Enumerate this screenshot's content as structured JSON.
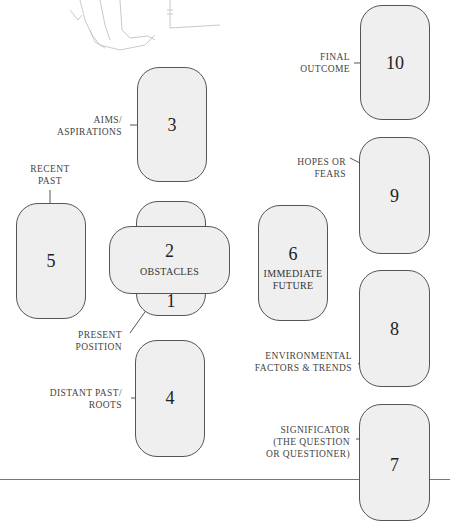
{
  "positions": [
    {
      "number": "1",
      "label": "PRESENT POSITION"
    },
    {
      "number": "2",
      "label": "OBSTACLES"
    },
    {
      "number": "3",
      "label_lines": [
        "AIMS/",
        "ASPIRATIONS"
      ]
    },
    {
      "number": "4",
      "label_lines": [
        "DISTANT PAST/",
        "ROOTS"
      ]
    },
    {
      "number": "5",
      "label_lines": [
        "RECENT",
        "PAST"
      ]
    },
    {
      "number": "6",
      "label_lines": [
        "IMMEDIATE",
        "FUTURE"
      ]
    },
    {
      "number": "7",
      "label_lines": [
        "SIGNIFICATOR",
        "(THE QUESTION",
        "OR QUESTIONER)"
      ]
    },
    {
      "number": "8",
      "label_lines": [
        "ENVIRONMENTAL",
        "FACTORS & TRENDS"
      ]
    },
    {
      "number": "9",
      "label_lines": [
        "HOPES OR",
        "FEARS"
      ]
    },
    {
      "number": "10",
      "label_lines": [
        "FINAL",
        "OUTCOME"
      ]
    }
  ],
  "present_label_lines": [
    "PRESENT",
    "POSITION"
  ],
  "colors": {
    "card_fill": "#efefef",
    "card_border": "#555555",
    "text": "#333333"
  }
}
